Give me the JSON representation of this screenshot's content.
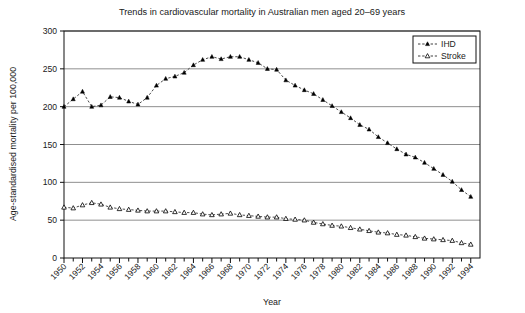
{
  "chart_data": {
    "type": "line",
    "title": "Trends in cardiovascular mortality in Australian men aged 20–69 years",
    "xlabel": "Year",
    "ylabel": "Age-standardised mortality per 100,000",
    "xlim": [
      1950,
      1995
    ],
    "ylim": [
      0,
      300
    ],
    "ytick_values": [
      0,
      50,
      100,
      150,
      200,
      250,
      300
    ],
    "ytick_labels": [
      "0",
      "50",
      "100",
      "150",
      "200",
      "250",
      "300"
    ],
    "xtick_labels": [
      "1950",
      "1952",
      "1954",
      "1956",
      "1958",
      "1960",
      "1962",
      "1964",
      "1966",
      "1968",
      "1970",
      "1972",
      "1974",
      "1976",
      "1978",
      "1980",
      "1982",
      "1984",
      "1986",
      "1988",
      "1990",
      "1992",
      "1994"
    ],
    "xtick_label_step_years": 2,
    "x_minor_tick_step_years": 1,
    "grid": "horizontal",
    "legend_position": "top-right",
    "x": [
      1950,
      1951,
      1952,
      1953,
      1954,
      1955,
      1956,
      1957,
      1958,
      1959,
      1960,
      1961,
      1962,
      1963,
      1964,
      1965,
      1966,
      1967,
      1968,
      1969,
      1970,
      1971,
      1972,
      1973,
      1974,
      1975,
      1976,
      1977,
      1978,
      1979,
      1980,
      1981,
      1982,
      1983,
      1984,
      1985,
      1986,
      1987,
      1988,
      1989,
      1990,
      1991,
      1992,
      1993,
      1994
    ],
    "series": [
      {
        "name": "IHD",
        "marker": "filled-triangle",
        "color": "#000000",
        "values": [
          200,
          210,
          220,
          200,
          202,
          213,
          212,
          207,
          203,
          212,
          228,
          237,
          240,
          245,
          255,
          262,
          266,
          263,
          266,
          266,
          262,
          258,
          250,
          249,
          235,
          228,
          222,
          217,
          209,
          201,
          193,
          185,
          176,
          170,
          160,
          152,
          144,
          137,
          133,
          126,
          118,
          110,
          101,
          90,
          81
        ]
      },
      {
        "name": "Stroke",
        "marker": "open-triangle",
        "color": "#000000",
        "values": [
          67,
          66,
          70,
          73,
          71,
          67,
          65,
          64,
          63,
          62,
          62,
          62,
          61,
          60,
          60,
          58,
          57,
          58,
          59,
          57,
          56,
          55,
          54,
          54,
          52,
          51,
          50,
          47,
          45,
          43,
          42,
          40,
          38,
          36,
          34,
          33,
          31,
          30,
          28,
          26,
          25,
          24,
          23,
          20,
          18
        ]
      }
    ]
  },
  "legend": {
    "entries": [
      {
        "label": "IHD"
      },
      {
        "label": "Stroke"
      }
    ]
  }
}
